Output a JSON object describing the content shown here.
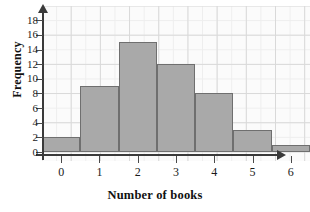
{
  "chart_data": {
    "type": "bar",
    "title": "",
    "subtitle": "",
    "xlabel": "Number of books",
    "ylabel": "Frequency",
    "categories": [
      "0",
      "1",
      "2",
      "3",
      "4",
      "5",
      "6"
    ],
    "values": [
      2,
      9,
      15,
      12,
      8,
      3,
      1
    ],
    "series": [
      {
        "name": "Frequency",
        "values": [
          2,
          9,
          15,
          12,
          8,
          3,
          1
        ]
      }
    ],
    "xlim": [
      -0.5,
      6.5
    ],
    "ylim": [
      0,
      18
    ],
    "y_ticks": [
      0,
      2,
      4,
      6,
      8,
      10,
      12,
      14,
      16,
      18
    ],
    "x_ticks": [
      "0",
      "1",
      "2",
      "3",
      "4",
      "5",
      "6"
    ],
    "grid": true,
    "legend": null,
    "legend_position": "none",
    "bar_fill_color": "#a9a9a9",
    "bar_border_color": "#6f6f6f",
    "grid_color": "#d9d9d9",
    "axis_color": "#3a3a3a",
    "background_color": "#fbfbfb",
    "annotations": []
  },
  "axes": {
    "y_title": "Frequency",
    "x_title": "Number of books",
    "y_tick_labels": [
      "0",
      "2",
      "4",
      "6",
      "8",
      "10",
      "12",
      "14",
      "16",
      "18"
    ],
    "x_tick_labels": [
      "0",
      "1",
      "2",
      "3",
      "4",
      "5",
      "6"
    ]
  }
}
